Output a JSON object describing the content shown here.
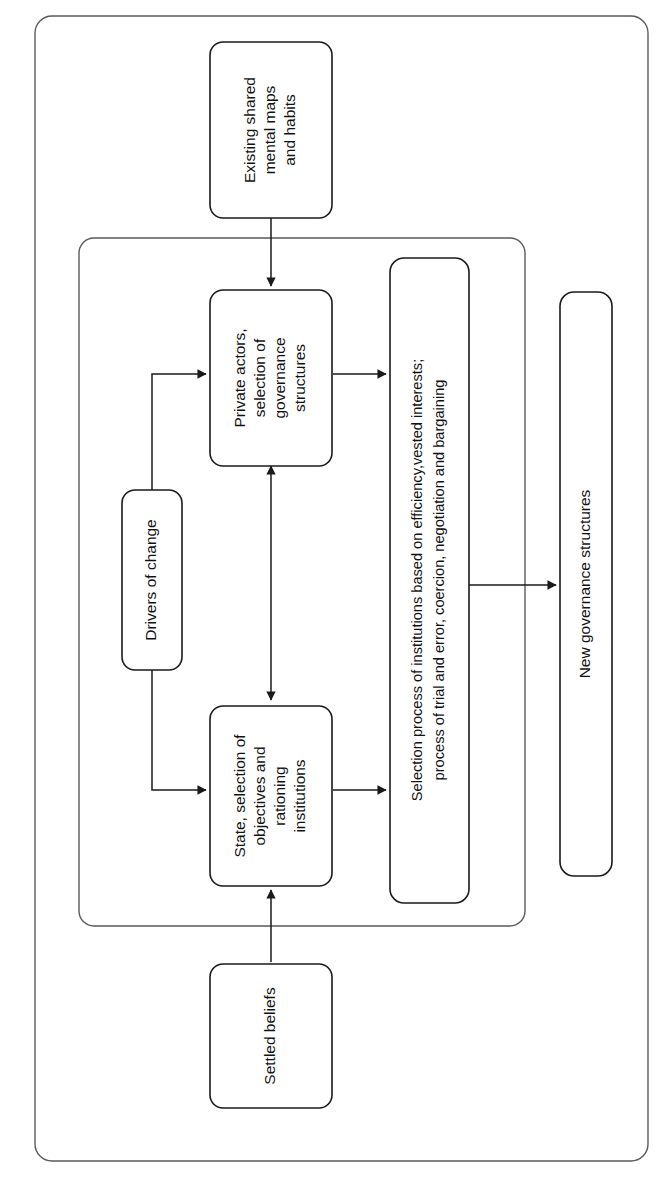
{
  "figure": {
    "type": "flow-diagram",
    "orientation": "rotated-90-ccw",
    "title": "",
    "background_color": "#ffffff",
    "line_color": "#1a1a1a",
    "container_color": "#5a5a5a"
  },
  "containers": [
    {
      "id": "outer",
      "label": ""
    },
    {
      "id": "inner",
      "label": ""
    }
  ],
  "nodes": [
    {
      "id": "existing-shared-mental-maps",
      "name": "existing-shared-mental-maps-and-habits",
      "lines": [
        "Existing shared",
        "mental maps",
        "and habits"
      ],
      "text": "Existing shared mental maps and habits"
    },
    {
      "id": "private-actors",
      "name": "private-actors-selection-of-governance-structures",
      "lines": [
        "Private actors,",
        "selection of",
        "governance",
        "structures"
      ],
      "text": "Private actors, selection of governance structures"
    },
    {
      "id": "drivers-of-change",
      "name": "drivers-of-change",
      "lines": [
        "Drivers of change"
      ],
      "text": "Drivers of change"
    },
    {
      "id": "selection-process",
      "name": "selection-process-of-institutions",
      "lines": [
        "Selection process of institutions based on efficiency,vested interests;",
        "process of trial and error, coercion, negotiation and bargaining"
      ],
      "text": "Selection process of institutions based on efficiency,vested interests; process of trial and error, coercion, negotiation and bargaining"
    },
    {
      "id": "state-selection",
      "name": "state-selection-of-objectives-and-rationing-institutions",
      "lines": [
        "State, selection of",
        "objectives and",
        "rationing",
        "institutions"
      ],
      "text": "State, selection of objectives and rationing institutions"
    },
    {
      "id": "settled-beliefs",
      "name": "settled-beliefs",
      "lines": [
        "Settled beliefs"
      ],
      "text": "Settled beliefs"
    },
    {
      "id": "new-governance-structures",
      "name": "new-governance-structures",
      "lines": [
        "New governance structures"
      ],
      "text": "New governance structures"
    }
  ],
  "edges": [
    {
      "id": "e1",
      "from": "existing-shared-mental-maps",
      "to": "private-actors",
      "arrow": "single"
    },
    {
      "id": "e2",
      "from": "drivers-of-change",
      "to": "private-actors",
      "arrow": "single"
    },
    {
      "id": "e3",
      "from": "drivers-of-change",
      "to": "state-selection",
      "arrow": "single"
    },
    {
      "id": "e4",
      "from": "private-actors",
      "to": "state-selection",
      "arrow": "double"
    },
    {
      "id": "e5",
      "from": "private-actors",
      "to": "selection-process",
      "arrow": "single"
    },
    {
      "id": "e6",
      "from": "state-selection",
      "to": "selection-process",
      "arrow": "single"
    },
    {
      "id": "e7",
      "from": "settled-beliefs",
      "to": "state-selection",
      "arrow": "single"
    },
    {
      "id": "e8",
      "from": "selection-process",
      "to": "new-governance-structures",
      "arrow": "single"
    }
  ]
}
